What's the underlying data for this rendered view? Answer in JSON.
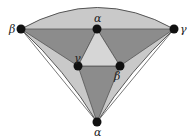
{
  "diagram": {
    "type": "triangulated spherical/curved triangle with vertex labels",
    "colors": {
      "outer_light": "#c9c9c9",
      "dark": "#8c8c8c",
      "center_light": "#d6d6d6",
      "edge": "#555555",
      "vertex": "#111111"
    },
    "vertices": [
      {
        "id": "v-beta-left",
        "label": "β",
        "x": 21,
        "y": 29,
        "lx": 9,
        "ly": 33
      },
      {
        "id": "v-alpha-top",
        "label": "α",
        "x": 97,
        "y": 29,
        "lx": 94,
        "ly": 22
      },
      {
        "id": "v-gamma-right",
        "label": "γ",
        "x": 174,
        "y": 29,
        "lx": 180,
        "ly": 33
      },
      {
        "id": "v-gamma-inner",
        "label": "γ",
        "x": 78,
        "y": 66,
        "lx": 74,
        "ly": 62
      },
      {
        "id": "v-beta-inner",
        "label": "β",
        "x": 120,
        "y": 66,
        "lx": 114,
        "ly": 80
      },
      {
        "id": "v-alpha-bottom",
        "label": "α",
        "x": 97,
        "y": 122,
        "lx": 94,
        "ly": 136
      }
    ]
  }
}
